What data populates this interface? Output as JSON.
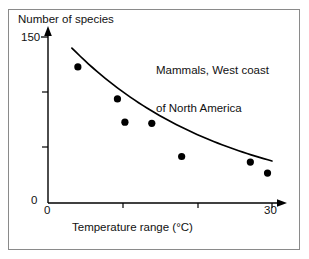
{
  "chart_data": {
    "type": "scatter",
    "title": "",
    "annotation": {
      "lines": [
        "Mammals, West coast",
        "of North America"
      ]
    },
    "xlabel": "Temperature range (°C)",
    "ylabel": "Number of species",
    "xlim": [
      0,
      30
    ],
    "ylim": [
      0,
      150
    ],
    "xticks": [
      0,
      10,
      20,
      30
    ],
    "xticklabels": [
      "0",
      "",
      "",
      "30"
    ],
    "yticks": [
      0,
      50,
      100,
      150
    ],
    "yticklabels": [
      "0",
      "",
      "",
      "150"
    ],
    "grid": false,
    "legend": null,
    "points": [
      {
        "x": 4.0,
        "y": 123
      },
      {
        "x": 9.3,
        "y": 94
      },
      {
        "x": 10.3,
        "y": 73
      },
      {
        "x": 13.9,
        "y": 72
      },
      {
        "x": 17.9,
        "y": 42
      },
      {
        "x": 27.1,
        "y": 37
      },
      {
        "x": 29.4,
        "y": 27
      }
    ],
    "fit_curve": {
      "label": "fitted decay curve",
      "x_start": 3.2,
      "x_end": 30.0,
      "y_start": 140,
      "y_end": 38
    },
    "marker": {
      "shape": "circle",
      "color": "#000000",
      "size": 5
    },
    "line_color": "#000000",
    "axis_color": "#000000",
    "frame_color": "#8a8a8a",
    "background": "#ffffff"
  },
  "axes": {
    "y_axis_title": "Number of species",
    "y_top_label": "150",
    "y_zero_label": "0",
    "x_zero_label": "0",
    "x_max_label": "30",
    "x_axis_title": "Temperature range (°C)"
  },
  "annotation": {
    "line1": "Mammals, West coast",
    "line2": "of North America"
  }
}
